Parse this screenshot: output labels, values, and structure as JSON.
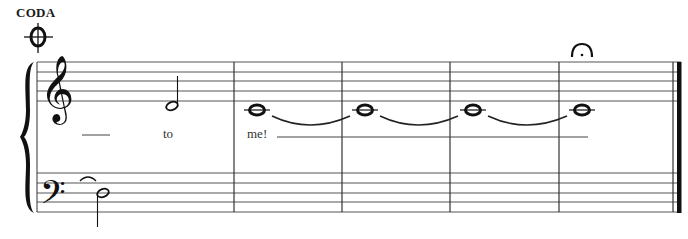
{
  "score": {
    "section_label": "CODA",
    "coda_symbol": "coda-sign",
    "fermata_symbol": "fermata",
    "system": {
      "staves": [
        "treble",
        "bass"
      ],
      "brace": true
    },
    "measures": [
      {
        "number": 1,
        "treble": [
          "half-rest-space",
          "half note D4"
        ],
        "bass": [
          "tie-in",
          "half note D3"
        ],
        "lyrics": [
          "__",
          "to"
        ]
      },
      {
        "number": 2,
        "treble": [
          "whole note C4 (tied)"
        ],
        "lyrics": [
          "me!"
        ]
      },
      {
        "number": 3,
        "treble": [
          "whole note C4 (tied)"
        ]
      },
      {
        "number": 4,
        "treble": [
          "whole note C4 (tied)"
        ]
      },
      {
        "number": 5,
        "treble": [
          "whole note C4 with fermata"
        ],
        "final_barline": true
      }
    ],
    "lyrics": {
      "extender_1": "",
      "word_1": "to",
      "word_2": "me!"
    }
  }
}
